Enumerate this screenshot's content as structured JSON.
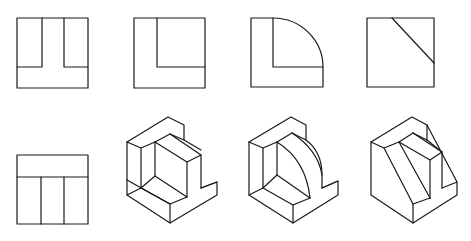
{
  "figure": {
    "top_row_views": [
      {
        "id": "view-1",
        "shape": "square with inverted-T / U-notch inner lines"
      },
      {
        "id": "view-2",
        "shape": "square with L inner lines"
      },
      {
        "id": "view-3",
        "shape": "L with quarter-circle arc"
      },
      {
        "id": "view-4",
        "shape": "square with diagonal line"
      }
    ],
    "bottom_row": [
      {
        "id": "view-5",
        "shape": "square with T inner lines"
      },
      {
        "id": "iso-1",
        "shape": "isometric T-block with rectangular recess"
      },
      {
        "id": "iso-2",
        "shape": "isometric T-block with curved quarter-round recess"
      },
      {
        "id": "iso-3",
        "shape": "isometric T-block with slanted face"
      }
    ],
    "caption": "                "
  },
  "colors": {
    "line": "#1a1a1a",
    "background": "#ffffff"
  }
}
